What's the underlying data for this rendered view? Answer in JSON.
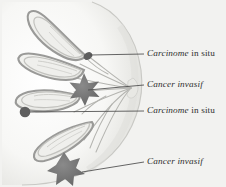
{
  "figure": {
    "palette": {
      "background": "#f2f2f0",
      "breast_fill": "#fbfbfa",
      "breast_shade": "#dcdcd8",
      "lobule_outer": "#9a9a98",
      "lobule_mid": "#c6c6c2",
      "lobule_inner": "#ededea",
      "duct_line": "#b0b0ac",
      "marker_tumor": "#6e6e6e",
      "marker_insitu": "#5f5f5f",
      "leader_line": "#4a4a4a",
      "text": "#2e2e2e"
    }
  },
  "labels": [
    {
      "id": "lbl-1",
      "term": "Carcinome",
      "tail": " in situ",
      "marker": "in-situ-duct-node"
    },
    {
      "id": "lbl-2",
      "term": "Cancer invasif",
      "tail": "",
      "marker": "invasive-star-upper"
    },
    {
      "id": "lbl-3",
      "term": "Carcinome",
      "tail": " in situ",
      "marker": "in-situ-lobule-nodule"
    },
    {
      "id": "lbl-4",
      "term": "Cancer invasif",
      "tail": "",
      "marker": "invasive-star-lower"
    }
  ]
}
